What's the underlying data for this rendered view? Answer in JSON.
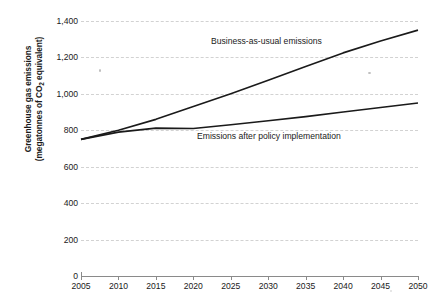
{
  "chart_data": {
    "type": "line",
    "title": "",
    "xlabel": "",
    "ylabel": "Greenhouse gas emissions (megatonnes of CO2 equivalent)",
    "ylabel_line1": "Greenhouse gas emissions",
    "ylabel_line2_pre": "(megatonnes of CO",
    "ylabel_line2_sub": "2",
    "ylabel_line2_post": " equivalent)",
    "x": [
      2005,
      2010,
      2015,
      2020,
      2025,
      2030,
      2035,
      2040,
      2045,
      2050
    ],
    "categories": [
      "2005",
      "2010",
      "2015",
      "2020",
      "2025",
      "2030",
      "2035",
      "2040",
      "2045",
      "2050"
    ],
    "xlim": [
      2005,
      2050
    ],
    "ylim": [
      0,
      1400
    ],
    "yticks": [
      0,
      200,
      400,
      600,
      800,
      1000,
      1200,
      1400
    ],
    "ytick_labels": [
      "0",
      "200",
      "400",
      "600",
      "800",
      "1,000",
      "1,200",
      "1,400"
    ],
    "grid": "horizontal-dashed",
    "legend_position": "inline-annotation",
    "series": [
      {
        "name": "Business-as-usual emissions",
        "values": [
          750,
          800,
          860,
          930,
          1000,
          1075,
          1150,
          1225,
          1290,
          1350
        ],
        "color": "#1a1a1a"
      },
      {
        "name": "Emissions after policy implementation",
        "values": [
          750,
          790,
          812,
          810,
          830,
          852,
          875,
          900,
          925,
          950
        ],
        "color": "#1a1a1a"
      }
    ],
    "annotations": [
      {
        "text": "Business-as-usual emissions",
        "series": "Business-as-usual emissions"
      },
      {
        "text": "Emissions after policy implementation",
        "series": "Emissions after policy implementation"
      }
    ]
  }
}
